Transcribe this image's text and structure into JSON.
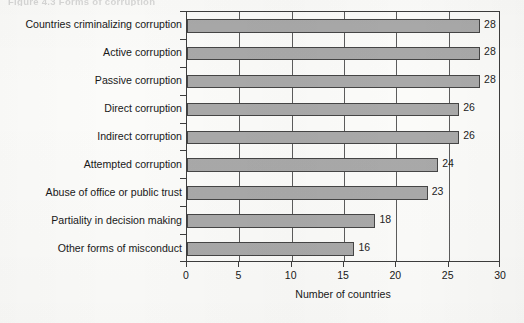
{
  "figure": {
    "caption_fragment": "Figure 4.3   Forms of corruption"
  },
  "chart_data": {
    "type": "bar",
    "orientation": "horizontal",
    "title": "",
    "subtitle": "",
    "xlabel": "Number of countries",
    "ylabel": "",
    "xlim": [
      0,
      30
    ],
    "xticks": [
      0,
      5,
      10,
      15,
      20,
      25,
      30
    ],
    "xtick_labels": [
      "0",
      "5",
      "10",
      "15",
      "20",
      "25",
      "30"
    ],
    "grid": "vertical",
    "legend": "none",
    "bar_color": "#a9a9a9",
    "bar_edge_color": "#454545",
    "categories": [
      "Countries criminalizing corruption",
      "Active corruption",
      "Passive corruption",
      "Direct corruption",
      "Indirect corruption",
      "Attempted corruption",
      "Abuse of office or public trust",
      "Partiality in decision making",
      "Other forms of misconduct"
    ],
    "values": [
      28,
      28,
      28,
      26,
      26,
      24,
      23,
      18,
      16
    ],
    "value_labels": [
      "28",
      "28",
      "28",
      "26",
      "26",
      "24",
      "23",
      "18",
      "16"
    ]
  }
}
